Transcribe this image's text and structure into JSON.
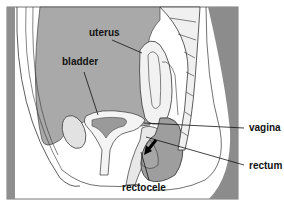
{
  "diagram": {
    "labels": {
      "uterus": "uterus",
      "bladder": "bladder",
      "vagina": "vagina",
      "rectum": "rectum",
      "rectocele": "rectocele"
    },
    "colors": {
      "tissue": "#a8a8a8",
      "dark_tissue": "#8a8a8a",
      "outline": "#333333",
      "background": "#ffffff"
    }
  }
}
